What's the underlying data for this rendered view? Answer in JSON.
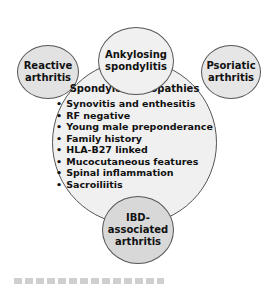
{
  "diagram": {
    "center": {
      "title": "Spondyloarthropathies",
      "features": [
        "Synovitis and enthesitis",
        "RF negative",
        "Young male preponderance",
        "Family history",
        "HLA-B27 linked",
        "Mucocutaneous features",
        "Spinal inflammation",
        "Sacroiliitis"
      ]
    },
    "satellites": {
      "top": {
        "line1": "Ankylosing",
        "line2": "spondylitis"
      },
      "left": {
        "line1": "Reactive",
        "line2": "arthritis"
      },
      "right": {
        "line1": "Psoriatic",
        "line2": "arthritis"
      },
      "bottom": {
        "line1": "IBD-associated",
        "line2": "arthritis"
      }
    },
    "colors": {
      "center_fill": "#f0f0f0",
      "top_fill": "#f0f0f0",
      "left_fill": "#e2e2e2",
      "right_fill": "#e6e6e6",
      "bottom_fill": "#d8d8d8",
      "outline": "#555555"
    }
  }
}
